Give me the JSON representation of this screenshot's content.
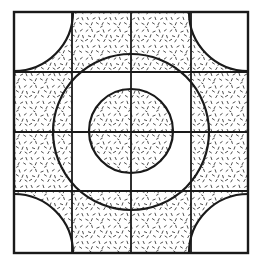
{
  "figure": {
    "background_color": "#ffffff",
    "stroke_color": "#1a1a1a",
    "stipple_color": "#3a3a3a",
    "canvas": {
      "width": 259,
      "height": 267
    }
  },
  "geometry": {
    "outer_square": {
      "x": 14,
      "y": 12,
      "width": 234,
      "height": 241,
      "stroke_width": 2.2
    },
    "grid": {
      "vertical_lines_x": [
        72,
        131,
        191
      ],
      "horizontal_lines_y": [
        72,
        132,
        191
      ],
      "stroke_width": 1.8,
      "note": "Three interior vertical lines and three interior horizontal lines forming a 4x4 cell grid"
    },
    "large_circle": {
      "cx": 131,
      "cy": 132,
      "r": 78,
      "stroke_width": 2.2
    },
    "center_circle": {
      "cx": 131,
      "cy": 131,
      "r": 42,
      "stroke_width": 2.2
    },
    "corner_quarter_circles": {
      "r": 59,
      "centers": [
        {
          "name": "top-left",
          "cx": 14,
          "cy": 12
        },
        {
          "name": "top-right",
          "cx": 248,
          "cy": 12
        },
        {
          "name": "bottom-left",
          "cx": 14,
          "cy": 253
        },
        {
          "name": "bottom-right",
          "cx": 248,
          "cy": 253
        }
      ],
      "stroke_width": 2.2,
      "note": "Quarter circles drawn from each corner of the outer square, arcs are not filled but bound stippled areas"
    }
  },
  "stipple": {
    "density": "fine",
    "mark_count": 1850,
    "mark_length_range": [
      1.6,
      3.4
    ],
    "mark_width": 0.9,
    "color": "#3a3a3a",
    "regions": [
      "ring between the large circle and the corner quarter-circle arcs",
      "interior of the center circle",
      "band between center circle and large circle outside the central square cell"
    ]
  },
  "labels": {
    "has_text_labels": false,
    "axis_labels": [],
    "legend_entries": [],
    "annotations": []
  }
}
